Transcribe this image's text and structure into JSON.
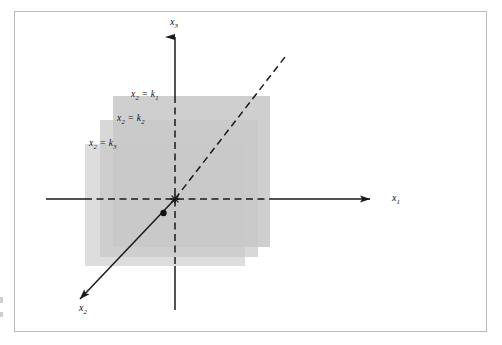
{
  "figure": {
    "type": "3d-coordinate-diagram",
    "background_color": "#ffffff",
    "frame_color": "#b9b9b9",
    "plane_fill_color": "#c9c9c9",
    "plane_overlap_color": "#b9b9b9",
    "axis_color": "#1a1a1a",
    "label_color": "#111111"
  },
  "axes": [
    {
      "name": "x1-axis",
      "label": "x",
      "subscript": "1",
      "direction": "right",
      "arrowhead": true,
      "label_x": 392,
      "label_y": 193
    },
    {
      "name": "x2-axis",
      "label": "x",
      "subscript": "2",
      "direction": "down-left",
      "arrowhead": true,
      "label_x": 79,
      "label_y": 303
    },
    {
      "name": "x3-axis",
      "label": "x",
      "subscript": "3",
      "direction": "up",
      "arrowhead": true,
      "label_x": 170,
      "label_y": 22
    }
  ],
  "planes": [
    {
      "name": "plane-k1",
      "label": "x",
      "subscript": "2",
      "equals": "=",
      "constant": "k",
      "constant_subscript": "1",
      "label_x": 131,
      "label_y": 95,
      "depth": "back"
    },
    {
      "name": "plane-k2",
      "label": "x",
      "subscript": "2",
      "equals": "=",
      "constant": "k",
      "constant_subscript": "2",
      "label_x": 117,
      "label_y": 119,
      "depth": "middle"
    },
    {
      "name": "plane-k3",
      "label": "x",
      "subscript": "2",
      "equals": "=",
      "constant": "k",
      "constant_subscript": "3",
      "label_x": 89,
      "label_y": 144,
      "depth": "front"
    }
  ],
  "origin": {
    "name": "origin-marker",
    "x": 175,
    "y": 199
  },
  "point": {
    "name": "data-point",
    "x": 163.5,
    "y": 213,
    "radius": 3.2
  }
}
